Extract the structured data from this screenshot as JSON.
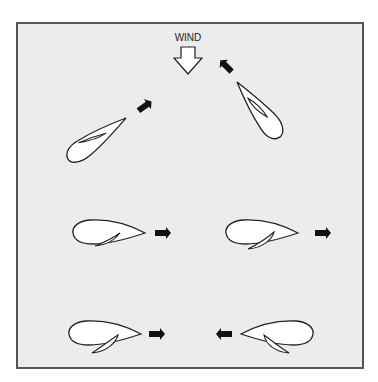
{
  "diagram": {
    "title_label": "WIND",
    "colors": {
      "page_background": "#ffffff",
      "panel_background": "#ececec",
      "panel_border": "#555555",
      "hull_fill": "#ffffff",
      "outline": "#222222",
      "direction_arrow": "#111111"
    },
    "wind": {
      "label": "WIND",
      "direction": "down",
      "icon": "hollow-down-arrow"
    },
    "boats": [
      {
        "id": "close-hauled-starboard",
        "position": "upper-left",
        "heading": "up-right",
        "arrow_icon": "arrow-up-right"
      },
      {
        "id": "close-hauled-port",
        "position": "upper-right",
        "heading": "up-left",
        "arrow_icon": "arrow-up-left"
      },
      {
        "id": "beam-reach-1",
        "position": "middle-left",
        "heading": "right",
        "arrow_icon": "arrow-right"
      },
      {
        "id": "beam-reach-2",
        "position": "middle-right",
        "heading": "right",
        "arrow_icon": "arrow-right"
      },
      {
        "id": "broad-reach-right",
        "position": "bottom-left",
        "heading": "right",
        "arrow_icon": "arrow-right"
      },
      {
        "id": "broad-reach-left",
        "position": "bottom-right",
        "heading": "left",
        "arrow_icon": "arrow-left"
      }
    ]
  }
}
